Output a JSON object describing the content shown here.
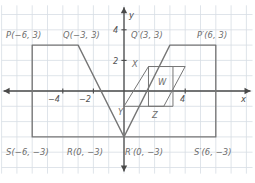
{
  "figure": {
    "kind": "coordinate-grid-reflection-diagram",
    "axis_labels": {
      "x": "x",
      "y": "y"
    },
    "x_ticks": [
      {
        "value": -4,
        "text": "−4"
      },
      {
        "value": -2,
        "text": "−2"
      },
      {
        "value": 4,
        "text": "4"
      }
    ],
    "y_ticks": [
      {
        "value": 2,
        "text": "2"
      },
      {
        "value": 4,
        "text": "4"
      }
    ],
    "vertex_labels": [
      {
        "name": "P",
        "text": "P(−6, 3)"
      },
      {
        "name": "Q",
        "text": "Q(−3, 3)"
      },
      {
        "name": "Q-prime",
        "text": "Q′(3, 3)"
      },
      {
        "name": "P-prime",
        "text": "P′(6, 3)"
      },
      {
        "name": "S",
        "text": "S(−6, −3)"
      },
      {
        "name": "R",
        "text": "R(0, −3)"
      },
      {
        "name": "R-prime",
        "text": "R′(0, −3)"
      },
      {
        "name": "S-prime",
        "text": "S′(6, −3)"
      }
    ],
    "inner_labels": [
      {
        "name": "X",
        "text": "X"
      },
      {
        "name": "W",
        "text": "W"
      },
      {
        "name": "Y",
        "text": "Y"
      },
      {
        "name": "Z",
        "text": "Z"
      }
    ],
    "colors": {
      "grid": "#d7dde4",
      "axis": "#4a4a4a",
      "shape_stroke": "#767676",
      "label_text": "#6d6d6d",
      "background": "#ffffff"
    },
    "shapes": {
      "preimage_PQRS": {
        "label": "PQRS",
        "points_units": [
          [
            -6,
            3
          ],
          [
            -3,
            3
          ],
          [
            0,
            -3
          ],
          [
            -6,
            -3
          ]
        ]
      },
      "image_PQRS_prime": {
        "label": "P′Q′R′S′",
        "points_units": [
          [
            6,
            3
          ],
          [
            3,
            3
          ],
          [
            0,
            -3
          ],
          [
            6,
            -3
          ]
        ]
      },
      "parallelogram_XYZW": {
        "label": "XYZW",
        "points_units": [
          [
            1.6,
            1.6
          ],
          [
            0.0,
            -1.0
          ],
          [
            2.6,
            -1.0
          ],
          [
            4.0,
            1.6
          ]
        ]
      },
      "rectangle_inner": {
        "label": "inner-rectangle",
        "points_units": [
          [
            1.6,
            1.6
          ],
          [
            3.2,
            1.6
          ],
          [
            3.2,
            -1.0
          ],
          [
            1.6,
            -1.0
          ]
        ]
      }
    },
    "grid": {
      "origin_px": [
        124.0,
        91.0
      ],
      "unit_px": 15.3,
      "x_range_units": [
        -8.0,
        8.4
      ],
      "y_range_units": [
        -5.4,
        5.6
      ],
      "show_grid": true
    }
  }
}
